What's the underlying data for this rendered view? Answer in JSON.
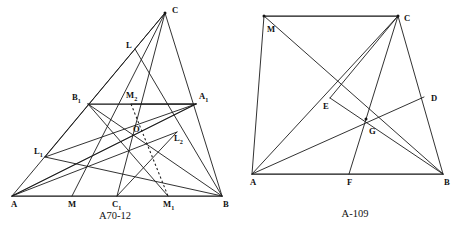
{
  "page": {
    "background_color": "#ffffff",
    "ink_color": "#141414",
    "width": 461,
    "height": 232
  },
  "figures": [
    {
      "id": "figure-left",
      "caption": "A70-12",
      "caption_position": {
        "x": 115,
        "y": 219
      },
      "points": [
        {
          "name": "A",
          "label": "A",
          "sub": "",
          "x": 12,
          "y": 196,
          "label_x": 11,
          "label_y": 205,
          "dot": false
        },
        {
          "name": "B",
          "label": "B",
          "sub": "",
          "x": 222,
          "y": 196,
          "label_x": 223,
          "label_y": 205,
          "dot": false
        },
        {
          "name": "C",
          "label": "C",
          "sub": "",
          "x": 165,
          "y": 13,
          "label_x": 172,
          "label_y": 11,
          "dot": true
        },
        {
          "name": "M",
          "label": "M",
          "sub": "",
          "x": 72,
          "y": 196,
          "label_x": 68,
          "label_y": 205,
          "dot": false
        },
        {
          "name": "C1",
          "label": "C",
          "sub": "1",
          "x": 117,
          "y": 196,
          "label_x": 112,
          "label_y": 205,
          "dot": false
        },
        {
          "name": "M1",
          "label": "M",
          "sub": "1",
          "x": 168,
          "y": 196,
          "label_x": 163,
          "label_y": 205,
          "dot": false
        },
        {
          "name": "B1",
          "label": "B",
          "sub": "1",
          "x": 88,
          "y": 104,
          "label_x": 72,
          "label_y": 98,
          "dot": false
        },
        {
          "name": "A1",
          "label": "A",
          "sub": "1",
          "x": 196,
          "y": 104,
          "label_x": 199,
          "label_y": 97,
          "dot": false
        },
        {
          "name": "M2",
          "label": "M",
          "sub": "2",
          "x": 131,
          "y": 104,
          "label_x": 126,
          "label_y": 96,
          "dot": false
        },
        {
          "name": "L",
          "label": "L",
          "sub": "",
          "x": 135,
          "y": 49,
          "label_x": 126,
          "label_y": 46,
          "dot": false
        },
        {
          "name": "L1",
          "label": "L",
          "sub": "1",
          "x": 45,
          "y": 157,
          "label_x": 34,
          "label_y": 152,
          "dot": false
        },
        {
          "name": "L2",
          "label": "L",
          "sub": "2",
          "x": 177,
          "y": 132,
          "label_x": 174,
          "label_y": 139,
          "dot": false
        },
        {
          "name": "O",
          "label": "O",
          "sub": "",
          "x": 131,
          "y": 139,
          "label_x": 133,
          "label_y": 130,
          "dot": false
        }
      ],
      "segments": [
        {
          "name": "side-AB",
          "from": "A",
          "to": "B",
          "style": "heavy"
        },
        {
          "name": "side-AC",
          "from": "A",
          "to": "C",
          "style": "plain"
        },
        {
          "name": "side-BC",
          "from": "B",
          "to": "C",
          "style": "plain"
        },
        {
          "name": "midline-B1-A1",
          "from": "B1",
          "to": "A1",
          "style": "heavy"
        },
        {
          "name": "cevian-C-C1",
          "from": "C",
          "to": "C1",
          "style": "plain"
        },
        {
          "name": "cevian-A-A1",
          "from": "A",
          "to": "A1",
          "style": "plain"
        },
        {
          "name": "cevian-B-B1",
          "from": "B",
          "to": "B1",
          "style": "plain"
        },
        {
          "name": "cevian-C-M",
          "from": "C",
          "to": "M",
          "style": "plain"
        },
        {
          "name": "line-L1-A1",
          "from": "L1",
          "to": "A1",
          "style": "plain"
        },
        {
          "name": "line-L1-B",
          "from": "L1",
          "to": "B",
          "style": "plain"
        },
        {
          "name": "line-A-L2",
          "from": "A",
          "to": "L2",
          "style": "plain"
        },
        {
          "name": "line-L2-M1",
          "from": "L2",
          "to": "C1",
          "style": "plain"
        },
        {
          "name": "line-B1-M1",
          "from": "B1",
          "to": "M1",
          "style": "plain"
        },
        {
          "name": "line-M2-A1",
          "from": "M2",
          "to": "A1",
          "style": "plain"
        },
        {
          "name": "line-A-A1-ext",
          "from": "A",
          "to": "A1",
          "style": "plain"
        },
        {
          "name": "line-L-B",
          "from": "L",
          "to": "B",
          "style": "plain"
        },
        {
          "name": "line-C-L1",
          "from": "C",
          "to": "L1",
          "style": "plain"
        }
      ],
      "dashed_segments": [
        {
          "name": "dashed-M2-M1",
          "from": "M2",
          "to": "M1"
        }
      ]
    },
    {
      "id": "figure-right",
      "caption": "A-109",
      "caption_position": {
        "x": 355,
        "y": 217
      },
      "points": [
        {
          "name": "A",
          "label": "A",
          "sub": "",
          "x": 252,
          "y": 174,
          "label_x": 250,
          "label_y": 183,
          "dot": false
        },
        {
          "name": "B",
          "label": "B",
          "sub": "",
          "x": 443,
          "y": 174,
          "label_x": 444,
          "label_y": 183,
          "dot": false
        },
        {
          "name": "C",
          "label": "C",
          "sub": "",
          "x": 398,
          "y": 16,
          "label_x": 404,
          "label_y": 19,
          "dot": true
        },
        {
          "name": "M",
          "label": "M",
          "sub": "",
          "x": 264,
          "y": 16,
          "label_x": 267,
          "label_y": 30,
          "dot": true
        },
        {
          "name": "D",
          "label": "D",
          "sub": "",
          "x": 424,
          "y": 97,
          "label_x": 431,
          "label_y": 99,
          "dot": false
        },
        {
          "name": "E",
          "label": "E",
          "sub": "",
          "x": 330,
          "y": 98,
          "label_x": 323,
          "label_y": 107,
          "dot": false
        },
        {
          "name": "F",
          "label": "F",
          "sub": "",
          "x": 349,
          "y": 174,
          "label_x": 347,
          "label_y": 183,
          "dot": false
        },
        {
          "name": "G",
          "label": "G",
          "sub": "",
          "x": 366,
          "y": 119,
          "label_x": 369,
          "label_y": 132,
          "dot": true
        }
      ],
      "segments": [
        {
          "name": "side-AB",
          "from": "A",
          "to": "B",
          "style": "heavy"
        },
        {
          "name": "side-AM",
          "from": "A",
          "to": "M",
          "style": "plain"
        },
        {
          "name": "side-MC",
          "from": "M",
          "to": "C",
          "style": "heavy"
        },
        {
          "name": "side-CB",
          "from": "C",
          "to": "B",
          "style": "plain"
        },
        {
          "name": "diag-M-B",
          "from": "M",
          "to": "B",
          "style": "plain"
        },
        {
          "name": "diag-A-C",
          "from": "A",
          "to": "C",
          "style": "plain"
        },
        {
          "name": "cevian-C-F",
          "from": "C",
          "to": "F",
          "style": "plain"
        },
        {
          "name": "cevian-A-D",
          "from": "A",
          "to": "D",
          "style": "plain"
        },
        {
          "name": "segment-E-B",
          "from": "E",
          "to": "B",
          "style": "plain"
        },
        {
          "name": "segment-C-E",
          "from": "C",
          "to": "E",
          "style": "plain"
        }
      ],
      "dashed_segments": []
    }
  ]
}
